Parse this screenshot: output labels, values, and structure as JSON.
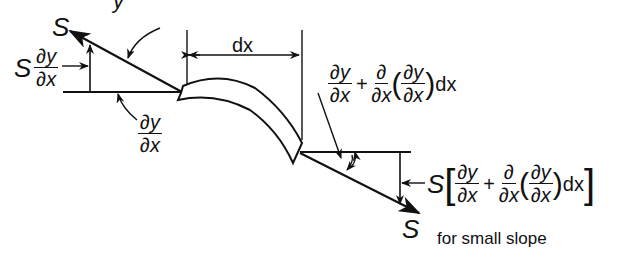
{
  "figure": {
    "top_fragment": "y",
    "left_force_label": "S",
    "left_vertical_component": {
      "prefix": "S",
      "num": "∂y",
      "den": "∂x"
    },
    "left_slope_label": {
      "num": "∂y",
      "den": "∂x"
    },
    "segment_width_label": "dx",
    "right_slope_label": {
      "term1_num": "∂y",
      "term1_den": "∂x",
      "plus": "+",
      "term2_num": "∂",
      "term2_den": "∂x",
      "inner_num": "∂y",
      "inner_den": "∂x",
      "lparen": "(",
      "rparen": ")",
      "tail": "dx"
    },
    "right_vertical_component": {
      "prefix": "S",
      "lbracket": "[",
      "rbracket": "]",
      "term1_num": "∂y",
      "term1_den": "∂x",
      "plus": "+",
      "term2_num": "∂",
      "term2_den": "∂x",
      "inner_num": "∂y",
      "inner_den": "∂x",
      "lparen": "(",
      "rparen": ")",
      "tail": "dx"
    },
    "right_force_label": "S",
    "caption": "for small slope",
    "colors": {
      "ink": "#111111",
      "background": "#ffffff"
    }
  }
}
